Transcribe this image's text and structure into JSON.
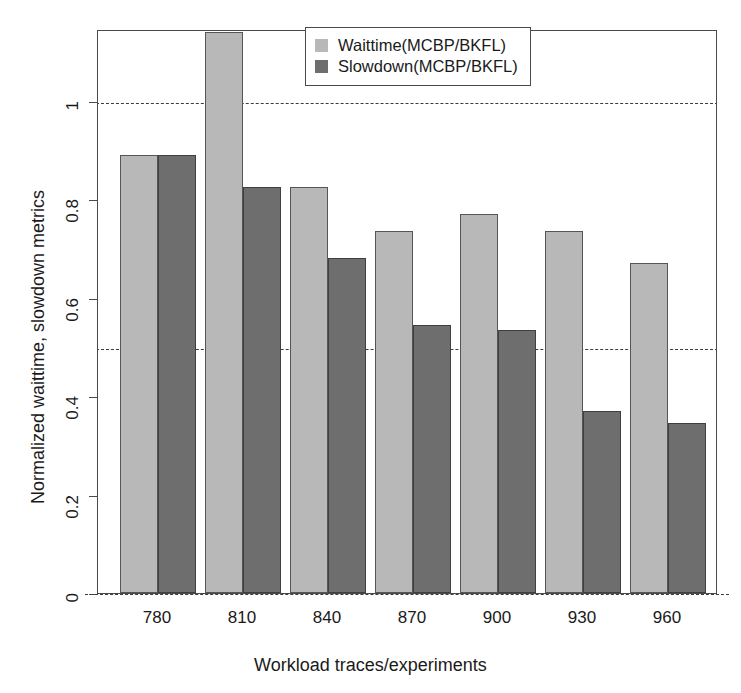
{
  "chart_data": {
    "type": "bar",
    "title": "",
    "xlabel": "Workload traces/experiments",
    "ylabel": "Normalized waittime, slowdown metrics",
    "categories": [
      "780",
      "810",
      "840",
      "870",
      "900",
      "930",
      "960"
    ],
    "series": [
      {
        "name": "Waittime(MCBP/BKFL)",
        "color": "#b8b8b8",
        "values": [
          0.89,
          1.14,
          0.825,
          0.735,
          0.77,
          0.735,
          0.67
        ]
      },
      {
        "name": "Slowdown(MCBP/BKFL)",
        "color": "#6e6e6e",
        "values": [
          0.89,
          0.825,
          0.68,
          0.545,
          0.535,
          0.37,
          0.345
        ]
      }
    ],
    "ylim": [
      0,
      1.146
    ],
    "yticks": [
      0,
      0.2,
      0.4,
      0.6,
      0.8,
      1
    ],
    "ytick_labels": [
      "0",
      "0.2",
      "0.4",
      "0.6",
      "0.8",
      "1"
    ],
    "reference_lines": [
      0,
      0.5,
      1
    ],
    "grid": false,
    "legend_position": "top-center",
    "note": "First series bar for category 810 is clipped by the plot top edge"
  },
  "legend": {
    "entries": [
      {
        "label": "Waittime(MCBP/BKFL)",
        "swatch": "light-gray-swatch"
      },
      {
        "label": "Slowdown(MCBP/BKFL)",
        "swatch": "dark-gray-swatch"
      }
    ]
  },
  "axes": {
    "y_title": "Normalized waittime, slowdown metrics",
    "x_title": "Workload traces/experiments"
  }
}
